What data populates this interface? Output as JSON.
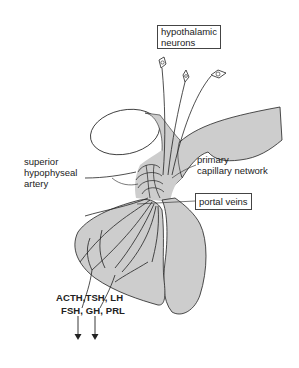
{
  "diagram": {
    "colors": {
      "tissue_fill": "#cdcdcd",
      "stroke": "#222222",
      "background": "#ffffff"
    },
    "labels": {
      "hypothalamic_neurons_line1": "hypothalamic",
      "hypothalamic_neurons_line2": "neurons",
      "superior_line1": "superior",
      "superior_line2": "hypophyseal",
      "superior_line3": "artery",
      "primary_line1": "primary",
      "primary_line2": "capillary network",
      "portal_veins": "portal veins"
    },
    "hormones": {
      "line1": "ACTH,TSH, LH",
      "line2": "FSH, GH, PRL"
    },
    "nodes": [
      {
        "id": "hypothalamic-neurons",
        "label": "hypothalamic neurons",
        "boxed": true
      },
      {
        "id": "superior-hypophyseal-artery",
        "label": "superior hypophyseal artery"
      },
      {
        "id": "primary-capillary-network",
        "label": "primary capillary network"
      },
      {
        "id": "portal-veins",
        "label": "portal veins",
        "boxed": true
      },
      {
        "id": "anterior-pituitary-hormones",
        "label": "ACTH, TSH, LH, FSH, GH, PRL"
      }
    ],
    "edges": [
      {
        "from": "hypothalamic-neurons",
        "to": "primary-capillary-network",
        "type": "axons"
      },
      {
        "from": "superior-hypophyseal-artery",
        "to": "primary-capillary-network",
        "type": "blood supply"
      },
      {
        "from": "primary-capillary-network",
        "to": "portal-veins",
        "type": "blood flow"
      },
      {
        "from": "portal-veins",
        "to": "anterior-pituitary-hormones",
        "type": "release (arrows down)"
      }
    ]
  }
}
